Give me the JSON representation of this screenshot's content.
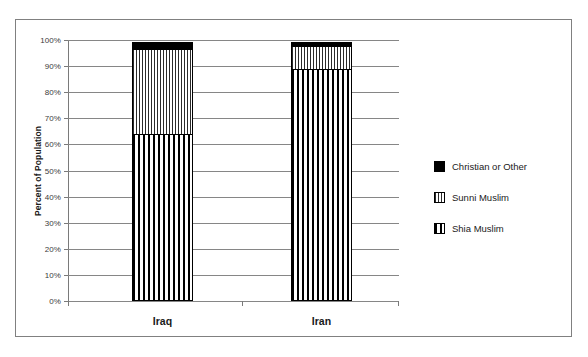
{
  "chart_data": {
    "type": "bar",
    "subtype": "stacked-100-percent",
    "title": "",
    "xlabel": "",
    "ylabel": "Percent of Population",
    "categories": [
      "Iraq",
      "Iran"
    ],
    "ylim": [
      0,
      100
    ],
    "ytick_labels": [
      "0%",
      "10%",
      "20%",
      "30%",
      "40%",
      "50%",
      "60%",
      "70%",
      "80%",
      "90%",
      "100%"
    ],
    "ytick_values": [
      0,
      10,
      20,
      30,
      40,
      50,
      60,
      70,
      80,
      90,
      100
    ],
    "grid": true,
    "legend_position": "right",
    "series": [
      {
        "name": "Christian or Other",
        "pattern": "solid-black",
        "color": "#000000",
        "values": [
          3,
          2
        ]
      },
      {
        "name": "Sunni Muslim",
        "pattern": "vertical-stripes",
        "color": "#2b2b2b",
        "values": [
          33,
          9
        ]
      },
      {
        "name": "Shia Muslim",
        "pattern": "dotted-grid",
        "color": "#000000",
        "values": [
          64,
          89
        ]
      }
    ]
  },
  "axis": {
    "y_title": "Percent of Population",
    "ticks": [
      {
        "label": "100%",
        "value": 100
      },
      {
        "label": "90%",
        "value": 90
      },
      {
        "label": "80%",
        "value": 80
      },
      {
        "label": "70%",
        "value": 70
      },
      {
        "label": "60%",
        "value": 60
      },
      {
        "label": "50%",
        "value": 50
      },
      {
        "label": "40%",
        "value": 40
      },
      {
        "label": "30%",
        "value": 30
      },
      {
        "label": "20%",
        "value": 20
      },
      {
        "label": "10%",
        "value": 10
      },
      {
        "label": "0%",
        "value": 0
      }
    ]
  },
  "bars": [
    {
      "category": "Iraq",
      "segments": [
        {
          "name": "Christian or Other",
          "value": 3
        },
        {
          "name": "Sunni Muslim",
          "value": 33
        },
        {
          "name": "Shia Muslim",
          "value": 64
        }
      ]
    },
    {
      "category": "Iran",
      "segments": [
        {
          "name": "Christian or Other",
          "value": 2
        },
        {
          "name": "Sunni Muslim",
          "value": 9
        },
        {
          "name": "Shia Muslim",
          "value": 89
        }
      ]
    }
  ],
  "legend": {
    "items": [
      {
        "label": "Christian or Other",
        "pattern": "solid"
      },
      {
        "label": "Sunni Muslim",
        "pattern": "vstripe"
      },
      {
        "label": "Shia Muslim",
        "pattern": "dots"
      }
    ]
  },
  "colors": {
    "frame": "#808080",
    "grid": "#868686",
    "axis": "#7a7a7a",
    "text": "#1a1a1a",
    "solid_fill": "#000000",
    "background": "#ffffff"
  }
}
